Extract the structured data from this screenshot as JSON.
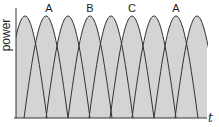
{
  "diagram": {
    "y_axis_label": "power",
    "x_axis_label": "t",
    "peak_labels": [
      {
        "text": "A",
        "x": 49
      },
      {
        "text": "B",
        "x": 90
      },
      {
        "text": "C",
        "x": 132
      },
      {
        "text": "A",
        "x": 176
      }
    ],
    "colors": {
      "fill": "#d4d4d4",
      "stroke": "#333333",
      "axis": "#333333"
    },
    "plot": {
      "x_axis_y": 118,
      "y_axis_x": 16,
      "fill_right": 207,
      "peak_y": 16,
      "peak_xs": [
        25,
        46,
        68,
        90,
        111,
        132,
        154,
        176,
        197
      ],
      "half_width": 22
    }
  }
}
